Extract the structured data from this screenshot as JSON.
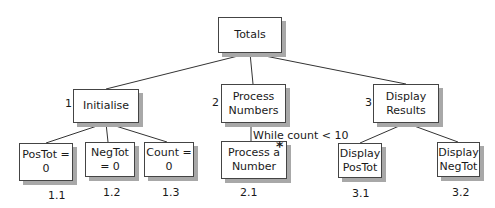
{
  "diagram": {
    "type": "structure-chart",
    "root": {
      "label": "Totals"
    },
    "nodes": [
      {
        "id": "1",
        "label": "Initialise"
      },
      {
        "id": "2",
        "label": "Process Numbers"
      },
      {
        "id": "3",
        "label": "Display Results"
      },
      {
        "id": "1.1",
        "label": "PosTot = 0"
      },
      {
        "id": "1.2",
        "label": "NegTot = 0"
      },
      {
        "id": "1.3",
        "label": "Count = 0"
      },
      {
        "id": "2.1",
        "label": "Process a Number",
        "marker": "*"
      },
      {
        "id": "3.1",
        "label": "Display PosTot"
      },
      {
        "id": "3.2",
        "label": "Display NegTot"
      }
    ],
    "loop_condition": "While count < 10"
  }
}
